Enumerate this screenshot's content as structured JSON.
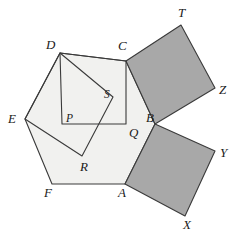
{
  "figure": {
    "canvas": {
      "width": 240,
      "height": 239
    },
    "colors": {
      "background": "#ffffff",
      "pentagon_fill": "#f1f1ef",
      "square_shaded_fill": "#a8a8a8",
      "inner_square_fill": "#f1f1ef",
      "stroke": "#3a3a3a",
      "label_color": "#1a1a1a"
    },
    "stroke_width": 1.1
  },
  "chart_data": {
    "type": "diagram",
    "points": {
      "A": {
        "x": 125,
        "y": 184
      },
      "B": {
        "x": 155,
        "y": 124
      },
      "C": {
        "x": 126,
        "y": 61
      },
      "D": {
        "x": 60,
        "y": 53
      },
      "E": {
        "x": 25,
        "y": 119
      },
      "F": {
        "x": 52,
        "y": 184
      },
      "P": {
        "x": 62,
        "y": 124
      },
      "Q": {
        "x": 126,
        "y": 124
      },
      "R": {
        "x": 82,
        "y": 156
      },
      "S": {
        "x": 113,
        "y": 97
      },
      "T": {
        "x": 181,
        "y": 25
      },
      "Z": {
        "x": 215,
        "y": 88
      },
      "Y": {
        "x": 215,
        "y": 151
      },
      "X": {
        "x": 185,
        "y": 216
      }
    },
    "shapes": [
      {
        "name": "pentagon-ABCDEF",
        "vertices": [
          "A",
          "B",
          "C",
          "D",
          "E",
          "F"
        ],
        "fill": "#f1f1ef",
        "shaded": false
      },
      {
        "name": "square-CTZB",
        "vertices": [
          "C",
          "T",
          "Z",
          "B"
        ],
        "fill": "#a8a8a8",
        "shaded": true
      },
      {
        "name": "square-BYXA",
        "vertices": [
          "B",
          "Y",
          "X",
          "A"
        ],
        "fill": "#a8a8a8",
        "shaded": true
      },
      {
        "name": "square-DCQP",
        "vertices": [
          "D",
          "C",
          "Q",
          "P"
        ],
        "fill": "none",
        "shaded": false
      },
      {
        "name": "quad-DSRE",
        "vertices": [
          "D",
          "S",
          "R",
          "E"
        ],
        "fill": "none",
        "shaded": false
      }
    ]
  },
  "labels": {
    "D": {
      "text": "D",
      "x": 46,
      "y": 38
    },
    "C": {
      "text": "C",
      "x": 118,
      "y": 39
    },
    "T": {
      "text": "T",
      "x": 178,
      "y": 6
    },
    "Z": {
      "text": "Z",
      "x": 219,
      "y": 83
    },
    "E": {
      "text": "E",
      "x": 8,
      "y": 112
    },
    "S": {
      "text": "S",
      "x": 104,
      "y": 89
    },
    "P": {
      "text": "P",
      "x": 66,
      "y": 113
    },
    "Q": {
      "text": "Q",
      "x": 129,
      "y": 126
    },
    "B": {
      "text": "B",
      "x": 146,
      "y": 111
    },
    "Y": {
      "text": "Y",
      "x": 220,
      "y": 146
    },
    "R": {
      "text": "R",
      "x": 80,
      "y": 160
    },
    "F": {
      "text": "F",
      "x": 44,
      "y": 186
    },
    "A": {
      "text": "A",
      "x": 118,
      "y": 186
    },
    "X": {
      "text": "X",
      "x": 183,
      "y": 218
    }
  }
}
